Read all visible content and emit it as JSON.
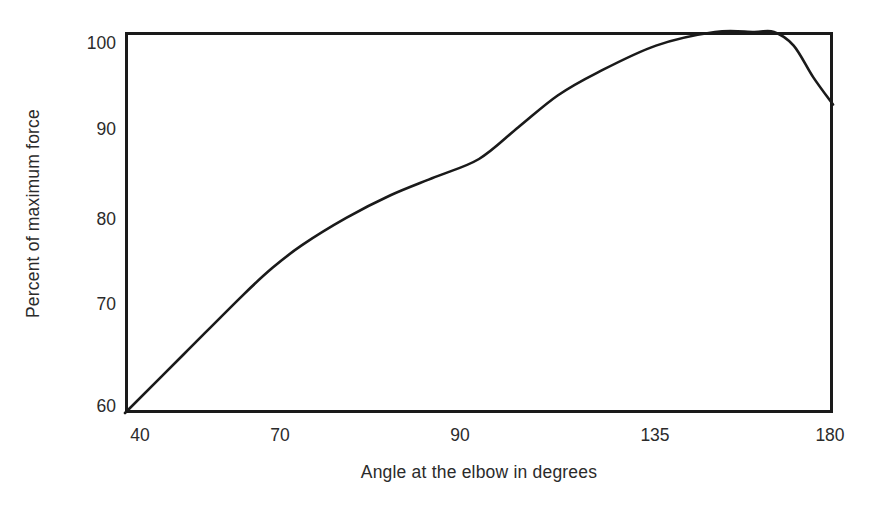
{
  "figure": {
    "background_color": "#ffffff",
    "line_color": "#1a1a1a",
    "frame_color": "#1a1a1a",
    "text_color": "#2b2b2b"
  },
  "axes": {
    "y_title": "Percent of maximum force",
    "x_title": "Angle at the elbow in degrees",
    "y_ticks": [
      {
        "label": "100",
        "top": 33
      },
      {
        "label": "90",
        "top": 119
      },
      {
        "label": "80",
        "top": 209
      },
      {
        "label": "70",
        "top": 294
      },
      {
        "label": "60",
        "top": 396
      }
    ],
    "x_ticks": [
      {
        "label": "40",
        "left": 140
      },
      {
        "label": "70",
        "left": 280
      },
      {
        "label": "90",
        "left": 460
      },
      {
        "label": "135",
        "left": 655
      },
      {
        "label": "180",
        "left": 830
      }
    ]
  },
  "chart_data": {
    "type": "line",
    "title": "",
    "subtitle": "",
    "xlabel": "Angle at the elbow in degrees",
    "ylabel": "Percent of maximum force",
    "xlim": [
      40,
      180
    ],
    "ylim": [
      59,
      101
    ],
    "grid": false,
    "legend": "none",
    "x_tick_labels": [
      "40",
      "70",
      "90",
      "135",
      "180"
    ],
    "x_tick_values": [
      40,
      70,
      90,
      135,
      180
    ],
    "x_axis_note": "tick labels are evenly spaced along the axis (not linear in value)",
    "y_tick_labels": [
      "60",
      "70",
      "80",
      "90",
      "100"
    ],
    "y_tick_values": [
      60,
      70,
      80,
      90,
      100
    ],
    "series": [
      {
        "name": "Elbow flexion force curve",
        "x": [
          40,
          50,
          60,
          65,
          70,
          75,
          80,
          85,
          90,
          100,
          110,
          120,
          135,
          150,
          160,
          165,
          170,
          175,
          180
        ],
        "values": [
          59,
          65.5,
          72,
          75,
          77.5,
          80.5,
          83,
          85,
          87,
          90.5,
          94,
          96.5,
          99.5,
          101,
          101,
          101,
          99.5,
          96,
          93
        ]
      }
    ],
    "annotations": [
      "curve rises steeply and nearly linearly from 40 to 70 degrees",
      "plateau at maximum (about 101 percent) between roughly 100 and 145 on the plotted axis",
      "force declines after the plateau, ending near 93 percent at 180 degrees"
    ]
  }
}
